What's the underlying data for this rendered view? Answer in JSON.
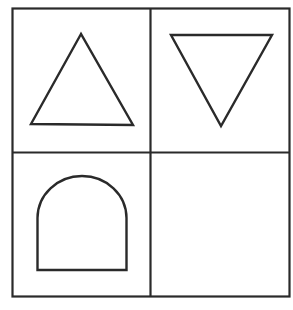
{
  "diagram": {
    "type": "shape-grid",
    "rows": 2,
    "cols": 2,
    "stroke_color": "#2a2a2a",
    "background": "#ffffff",
    "cells": [
      {
        "row": 0,
        "col": 0,
        "shape": "triangle-up"
      },
      {
        "row": 0,
        "col": 1,
        "shape": "triangle-down"
      },
      {
        "row": 1,
        "col": 0,
        "shape": "arch"
      },
      {
        "row": 1,
        "col": 1,
        "shape": "empty"
      }
    ]
  }
}
